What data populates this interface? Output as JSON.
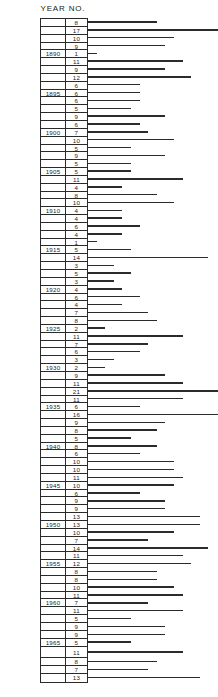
{
  "header": {
    "year_label": "YEAR",
    "no_label": "NO."
  },
  "chart_data": {
    "type": "bar",
    "orientation": "horizontal",
    "title": "",
    "xlabel": "",
    "ylabel": "YEAR",
    "columns": [
      "YEAR",
      "NO."
    ],
    "bar_scale_px_per_unit": 8.6,
    "xlim": [
      0,
      21
    ],
    "grid": false,
    "legend": null,
    "categories": [
      "",
      "",
      "",
      "",
      "1890",
      "",
      "",
      "",
      "",
      "1895",
      "",
      "",
      "",
      "",
      "1900",
      "",
      "",
      "",
      "",
      "1905",
      "",
      "",
      "",
      "",
      "1910",
      "",
      "",
      "",
      "",
      "1915",
      "",
      "",
      "",
      "",
      "1920",
      "",
      "",
      "",
      "",
      "1925",
      "",
      "",
      "",
      "",
      "1930",
      "",
      "",
      "",
      "",
      "1935",
      "",
      "",
      "",
      "",
      "1940",
      "",
      "",
      "",
      "",
      "1945",
      "",
      "",
      "",
      "",
      "1950",
      "",
      "",
      "",
      "",
      "1955",
      "",
      "",
      "",
      "",
      "1960",
      "",
      "",
      "",
      "",
      "1965",
      "",
      "",
      "",
      ""
    ],
    "values": [
      8,
      17,
      10,
      9,
      1,
      11,
      9,
      12,
      6,
      6,
      6,
      5,
      9,
      6,
      7,
      10,
      5,
      9,
      5,
      5,
      11,
      4,
      8,
      10,
      4,
      4,
      6,
      4,
      1,
      5,
      14,
      3,
      5,
      3,
      4,
      6,
      4,
      7,
      8,
      2,
      11,
      7,
      6,
      3,
      2,
      9,
      11,
      21,
      11,
      6,
      16,
      9,
      8,
      5,
      8,
      6,
      10,
      10,
      11,
      10,
      6,
      9,
      9,
      13,
      13,
      10,
      7,
      14,
      11,
      12,
      8,
      8,
      10,
      11,
      7,
      11,
      5,
      9,
      9,
      5,
      11,
      8,
      7,
      13
    ],
    "tall_rows": [
      80
    ]
  },
  "caption": ""
}
